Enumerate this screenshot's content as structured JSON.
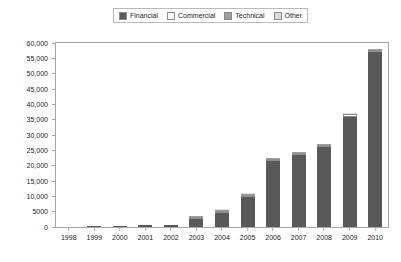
{
  "chart_data": {
    "type": "bar",
    "title": "",
    "subtitle": "",
    "xlabel": "",
    "ylabel": "",
    "stacked": true,
    "grid": false,
    "legend_position": "top-center",
    "ylim": [
      0,
      60000
    ],
    "ytick_labels": [
      "60,000",
      "55,000",
      "50,000",
      "45,000",
      "40,000",
      "35,000",
      "30,000",
      "25,000",
      "20,000",
      "15,000",
      "10,000",
      "5000",
      "0"
    ],
    "ytick_values": [
      60000,
      55000,
      50000,
      45000,
      40000,
      35000,
      30000,
      25000,
      20000,
      15000,
      10000,
      5000,
      0
    ],
    "categories": [
      "1998",
      "1999",
      "2000",
      "2001",
      "2002",
      "2003",
      "2004",
      "2005",
      "2006",
      "2007",
      "2008",
      "2009",
      "2010"
    ],
    "series": [
      {
        "name": "Financial",
        "color": "#595959",
        "values": [
          0,
          230,
          420,
          700,
          520,
          2600,
          4700,
          9900,
          21500,
          23400,
          26000,
          35800,
          57000
        ]
      },
      {
        "name": "Commercial",
        "color": "#ffffff",
        "values": [
          0,
          0,
          0,
          0,
          0,
          120,
          180,
          420,
          480,
          700,
          750,
          900,
          700
        ]
      },
      {
        "name": "Technical",
        "color": "#9e9e9e",
        "values": [
          0,
          0,
          0,
          0,
          0,
          80,
          100,
          150,
          180,
          200,
          220,
          250,
          200
        ]
      },
      {
        "name": "Other",
        "color": "#dcdcdc",
        "values": [
          0,
          0,
          0,
          0,
          0,
          60,
          80,
          110,
          130,
          150,
          160,
          180,
          150
        ]
      }
    ],
    "totals": [
      0,
      230,
      420,
      700,
      520,
      2860,
      5060,
      10580,
      22290,
      24450,
      27130,
      37130,
      58050
    ]
  },
  "legend": {
    "entries": [
      {
        "label": "Financial",
        "swatch": "legend-swatch-financial"
      },
      {
        "label": "Commercial",
        "swatch": "legend-swatch-commercial"
      },
      {
        "label": "Technical",
        "swatch": "legend-swatch-technical"
      },
      {
        "label": "Other",
        "swatch": "legend-swatch-other"
      }
    ]
  }
}
